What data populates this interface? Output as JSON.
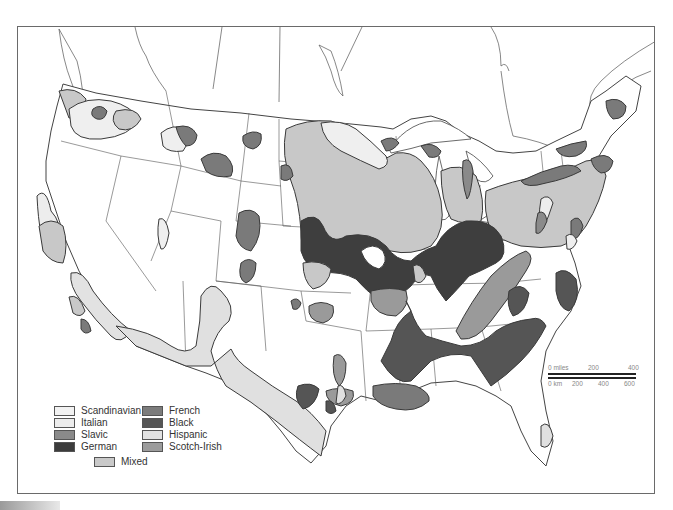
{
  "map": {
    "title": "Ethnic regions of the United States",
    "colors": {
      "Scandinavian": "#f0f0f0",
      "Italian": "#ececec",
      "Slavic": "#8c8c8c",
      "German": "#3f3f3f",
      "French": "#7a7a7a",
      "Black": "#555555",
      "Hispanic": "#e0e0e0",
      "Scotch-Irish": "#9a9a9a",
      "Mixed": "#c8c8c8",
      "outline": "#444444",
      "border": "#6a6a6a"
    }
  },
  "legend": {
    "items": [
      {
        "label": "Scandinavian",
        "color": "#f2f2f2"
      },
      {
        "label": "Italian",
        "color": "#ededed"
      },
      {
        "label": "Slavic",
        "color": "#8a8a8a"
      },
      {
        "label": "German",
        "color": "#3c3c3c"
      },
      {
        "label": "French",
        "color": "#7c7c7c"
      },
      {
        "label": "Black",
        "color": "#565656"
      },
      {
        "label": "Hispanic",
        "color": "#e2e2e2"
      },
      {
        "label": "Scotch-Irish",
        "color": "#9c9c9c"
      },
      {
        "label": "Mixed",
        "color": "#c9c9c9"
      }
    ]
  },
  "scale_bar": {
    "miles_label": "0 miles",
    "miles_ticks": [
      "200",
      "400"
    ],
    "km_label": "0 km",
    "km_ticks": [
      "200",
      "400",
      "600"
    ]
  }
}
